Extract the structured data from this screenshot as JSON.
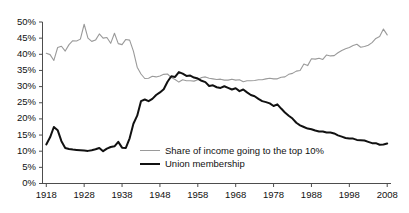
{
  "chart_data": {
    "type": "line",
    "title": "",
    "xlabel": "",
    "ylabel": "",
    "xlim": [
      1917,
      2009
    ],
    "ylim": [
      0,
      50
    ],
    "grid": false,
    "legend_position": "inside-center-bottom",
    "x_ticks": [
      "1918",
      "1928",
      "1938",
      "1948",
      "1958",
      "1968",
      "1978",
      "1988",
      "1998",
      "2008"
    ],
    "y_ticks": [
      "0%",
      "5%",
      "10%",
      "15%",
      "20%",
      "25%",
      "30%",
      "35%",
      "40%",
      "45%",
      "50%"
    ],
    "series": [
      {
        "name": "Share of income going to the top 10%",
        "color": "#9a9a9a",
        "width": 1.1,
        "x": [
          1918,
          1919,
          1920,
          1921,
          1922,
          1923,
          1924,
          1925,
          1926,
          1927,
          1928,
          1929,
          1930,
          1931,
          1932,
          1933,
          1934,
          1935,
          1936,
          1937,
          1938,
          1939,
          1940,
          1941,
          1942,
          1943,
          1944,
          1945,
          1946,
          1947,
          1948,
          1949,
          1950,
          1951,
          1952,
          1953,
          1954,
          1955,
          1956,
          1957,
          1958,
          1959,
          1960,
          1961,
          1962,
          1963,
          1964,
          1965,
          1966,
          1967,
          1968,
          1969,
          1970,
          1971,
          1972,
          1973,
          1974,
          1975,
          1976,
          1977,
          1978,
          1979,
          1980,
          1981,
          1982,
          1983,
          1984,
          1985,
          1986,
          1987,
          1988,
          1989,
          1990,
          1991,
          1992,
          1993,
          1994,
          1995,
          1996,
          1997,
          1998,
          1999,
          2000,
          2001,
          2002,
          2003,
          2004,
          2005,
          2006,
          2007,
          2008
        ],
        "values": [
          40.3,
          39.9,
          38.1,
          42.1,
          42.5,
          41.0,
          43.0,
          44.2,
          44.1,
          44.7,
          49.3,
          45.0,
          44.0,
          44.4,
          46.3,
          45.0,
          45.2,
          43.4,
          46.5,
          43.3,
          43.0,
          44.6,
          44.4,
          41.0,
          36.0,
          33.9,
          32.5,
          32.6,
          33.2,
          33.0,
          33.3,
          33.8,
          33.9,
          32.8,
          32.2,
          31.4,
          32.1,
          31.8,
          31.8,
          31.7,
          32.1,
          32.8,
          33.0,
          32.6,
          32.4,
          32.2,
          32.3,
          32.0,
          32.0,
          32.3,
          32.0,
          32.1,
          31.5,
          31.8,
          31.8,
          31.9,
          32.1,
          32.1,
          32.4,
          32.6,
          32.4,
          32.4,
          32.9,
          33.0,
          33.8,
          34.1,
          34.8,
          35.0,
          37.0,
          36.5,
          38.6,
          38.5,
          38.8,
          38.4,
          39.8,
          39.5,
          39.6,
          40.5,
          41.2,
          41.7,
          42.1,
          42.7,
          43.1,
          42.2,
          42.4,
          42.8,
          43.6,
          44.9,
          45.5,
          47.8,
          46.0
        ]
      },
      {
        "name": "Union membership",
        "color": "#111111",
        "width": 2.0,
        "x": [
          1918,
          1919,
          1920,
          1921,
          1922,
          1923,
          1924,
          1925,
          1926,
          1927,
          1928,
          1929,
          1930,
          1931,
          1932,
          1933,
          1934,
          1935,
          1936,
          1937,
          1938,
          1939,
          1940,
          1941,
          1942,
          1943,
          1944,
          1945,
          1946,
          1947,
          1948,
          1949,
          1950,
          1951,
          1952,
          1953,
          1954,
          1955,
          1956,
          1957,
          1958,
          1959,
          1960,
          1961,
          1962,
          1963,
          1964,
          1965,
          1966,
          1967,
          1968,
          1969,
          1970,
          1971,
          1972,
          1973,
          1974,
          1975,
          1976,
          1977,
          1978,
          1979,
          1980,
          1981,
          1982,
          1983,
          1984,
          1985,
          1986,
          1987,
          1988,
          1989,
          1990,
          1991,
          1992,
          1993,
          1994,
          1995,
          1996,
          1997,
          1998,
          1999,
          2000,
          2001,
          2002,
          2003,
          2004,
          2005,
          2006,
          2007,
          2008
        ],
        "values": [
          12.1,
          14.3,
          17.5,
          16.5,
          13.1,
          11.0,
          10.7,
          10.5,
          10.4,
          10.3,
          10.2,
          10.1,
          10.3,
          10.6,
          11.0,
          10.0,
          10.8,
          11.3,
          11.5,
          12.9,
          11.1,
          11.0,
          14.0,
          18.5,
          21.0,
          25.5,
          26.0,
          25.5,
          26.2,
          27.4,
          28.2,
          29.2,
          31.5,
          33.2,
          33.0,
          34.5,
          34.0,
          33.3,
          33.4,
          32.8,
          32.5,
          31.8,
          31.4,
          30.2,
          30.4,
          29.8,
          29.6,
          30.1,
          29.6,
          29.1,
          29.5,
          28.6,
          29.1,
          28.2,
          27.4,
          27.0,
          26.2,
          25.5,
          25.2,
          24.8,
          24.0,
          24.5,
          23.2,
          22.0,
          21.0,
          20.1,
          18.8,
          18.0,
          17.5,
          17.0,
          16.8,
          16.4,
          16.1,
          16.1,
          15.8,
          15.8,
          15.5,
          14.9,
          14.5,
          14.1,
          13.9,
          13.9,
          13.5,
          13.4,
          13.3,
          12.9,
          12.5,
          12.5,
          12.0,
          12.1,
          12.4
        ]
      }
    ]
  },
  "legend": {
    "entries": [
      {
        "label": "Share of income going to the top 10%",
        "swatch": "gray-line-swatch"
      },
      {
        "label": "Union membership",
        "swatch": "black-line-swatch"
      }
    ]
  },
  "axes": {
    "y_tick_labels": [
      "50%",
      "45%",
      "40%",
      "35%",
      "30%",
      "25%",
      "20%",
      "15%",
      "10%",
      "5%",
      "0%"
    ],
    "x_tick_labels": [
      "1918",
      "1928",
      "1938",
      "1948",
      "1958",
      "1968",
      "1978",
      "1988",
      "1998",
      "2008"
    ]
  },
  "colors": {
    "income_line": "#9a9a9a",
    "union_line": "#111111",
    "axis": "#4d4d4d",
    "text": "#111111",
    "background": "#ffffff"
  }
}
